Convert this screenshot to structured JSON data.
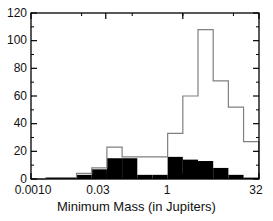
{
  "chart_data": {
    "type": "bar",
    "title": "",
    "subtitle": "",
    "xlabel": "Minimum Mass (in Jupiters)",
    "ylabel": "",
    "xscale": "log",
    "xlim": [
      0.001,
      32.0
    ],
    "ylim": [
      0,
      120
    ],
    "grid": false,
    "legend_position": "none",
    "xtick_labels": [
      "0.0010",
      "0.03",
      "1",
      "32"
    ],
    "xtick_values": [
      0.001,
      0.03,
      1,
      32
    ],
    "ytick_labels": [
      "0",
      "20",
      "40",
      "60",
      "80",
      "100",
      "120"
    ],
    "ytick_values": [
      0,
      20,
      40,
      60,
      80,
      100,
      120
    ],
    "bin_edges_log10": [
      -3.0,
      -2.7,
      -2.4,
      -2.1,
      -1.8,
      -1.5,
      -1.2,
      -0.9,
      -0.6,
      -0.3,
      0.0,
      0.3,
      0.6,
      0.9,
      1.2,
      1.5
    ],
    "series": [
      {
        "name": "open-histogram",
        "style": "outline",
        "color": "#000000",
        "fill": "none",
        "values": [
          0,
          1,
          1,
          4,
          8,
          23,
          16,
          16,
          16,
          33,
          60,
          108,
          71,
          52,
          27,
          3
        ]
      },
      {
        "name": "filled-histogram",
        "style": "filled",
        "color": "#000000",
        "fill": "#000000",
        "values": [
          0,
          1,
          1,
          3,
          7,
          15,
          15,
          3,
          3,
          16,
          14,
          13,
          8,
          3,
          1,
          1
        ]
      }
    ],
    "colors": {
      "axis": "#000000",
      "open_line": "#808080",
      "filled": "#000000",
      "background": "#ffffff",
      "text": "#111111"
    }
  },
  "axis_title": {
    "x": "Minimum Mass (in Jupiters)"
  }
}
